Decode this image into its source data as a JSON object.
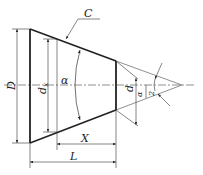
{
  "diagram": {
    "labels": {
      "C": "C",
      "D": "D",
      "dx": "d",
      "dx_sub": "x",
      "alpha": "α",
      "d": "d",
      "half_angle_num": "α",
      "half_angle_den": "2",
      "X": "X",
      "L": "L"
    },
    "colors": {
      "line": "#222222",
      "background": "#ffffff"
    }
  }
}
